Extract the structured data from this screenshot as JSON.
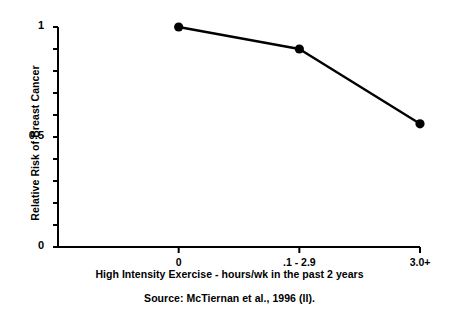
{
  "chart_data": {
    "type": "line",
    "title": "",
    "subtitle": "",
    "xlabel": "High Intensity Exercise - hours/wk in the past 2 years",
    "ylabel": "Relative Risk of Breast Cancer",
    "categories": [
      "0",
      ".1 - 2.9",
      "3.0+"
    ],
    "values": [
      1.0,
      0.9,
      0.56
    ],
    "series": [
      {
        "name": "Relative Risk of Breast Cancer",
        "values": [
          1.0,
          0.9,
          0.56
        ]
      }
    ],
    "ylim": [
      0,
      1
    ],
    "ytick_values": [
      0,
      0.1,
      0.2,
      0.3,
      0.4,
      0.5,
      0.6,
      0.7,
      0.8,
      0.9,
      1.0
    ],
    "ytick_labels_shown": [
      "0",
      "0.5",
      "1"
    ],
    "ytick_labels_shown_values": [
      0,
      0.5,
      1
    ],
    "grid": false,
    "legend": false,
    "legend_position": "none",
    "marker": "filled-circle",
    "line_color": "#000000",
    "marker_color": "#000000",
    "annotations": [
      "Source: McTiernan et al., 1996 (II)."
    ]
  },
  "figure": {
    "source_note": "Source: McTiernan et al., 1996 (II).",
    "axis_color": "#000000",
    "background_color": "#ffffff"
  }
}
